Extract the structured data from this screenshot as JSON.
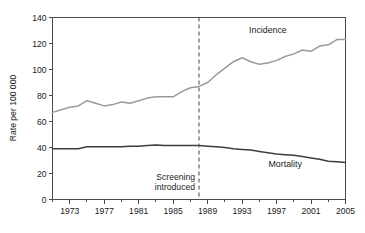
{
  "chart_data": {
    "type": "line",
    "title": "",
    "xlabel": "",
    "ylabel": "Rate per 100 000",
    "xlim": [
      1971,
      2005
    ],
    "ylim": [
      0,
      140
    ],
    "yticks": [
      0,
      20,
      40,
      60,
      80,
      100,
      120,
      140
    ],
    "ytick_labels": [
      "0",
      "20",
      "40",
      "60",
      "80",
      "100",
      "120",
      "140"
    ],
    "xticks": [
      1973,
      1977,
      1981,
      1985,
      1989,
      1993,
      1997,
      2001,
      2005
    ],
    "xtick_labels": [
      "1973",
      "1977",
      "1981",
      "1985",
      "1989",
      "1993",
      "1997",
      "2001",
      "2005"
    ],
    "minor_xticks": [
      1971,
      1975,
      1979,
      1983,
      1987,
      1991,
      1995,
      1999,
      2003
    ],
    "grid": false,
    "legend_position": "inline-labels",
    "x": [
      1971,
      1972,
      1973,
      1974,
      1975,
      1976,
      1977,
      1978,
      1979,
      1980,
      1981,
      1982,
      1983,
      1984,
      1985,
      1986,
      1987,
      1988,
      1989,
      1990,
      1991,
      1992,
      1993,
      1994,
      1995,
      1996,
      1997,
      1998,
      1999,
      2000,
      2001,
      2002,
      2003,
      2004,
      2005
    ],
    "series": [
      {
        "name": "Incidence",
        "color": "#9a9a9a",
        "values": [
          67,
          69,
          71,
          72,
          76,
          74,
          72,
          73,
          75,
          74,
          76,
          78,
          79,
          79,
          79,
          83,
          86,
          87,
          90,
          96,
          101,
          106,
          109,
          106,
          104,
          105,
          107,
          110,
          112,
          115,
          114,
          118,
          119,
          123,
          123
        ]
      },
      {
        "name": "Mortality",
        "color": "#3d3d3d",
        "values": [
          39,
          39,
          39,
          39,
          40.5,
          40.5,
          40.5,
          40.5,
          40.5,
          41,
          41,
          41.5,
          42,
          41.5,
          41.5,
          41.5,
          41.5,
          41.5,
          41,
          40.5,
          40,
          39,
          38.5,
          38,
          37,
          36,
          35,
          34.5,
          34,
          33,
          32,
          31,
          29.5,
          29,
          28.5
        ]
      }
    ],
    "annotations": [
      {
        "name": "screening-introduced",
        "text_line1": "Screening",
        "text_line2": "introduced",
        "x": 1988,
        "line_style": "dashed"
      },
      {
        "name": "incidence-label",
        "text": "Incidence",
        "x": 1996,
        "y": 128
      },
      {
        "name": "mortality-label",
        "text": "Mortality",
        "x": 1998,
        "y": 25
      }
    ]
  }
}
